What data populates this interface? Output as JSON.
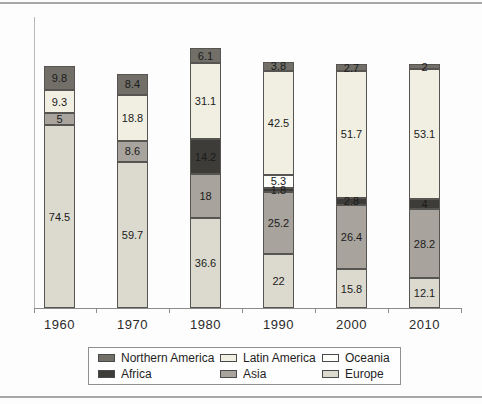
{
  "figure": {
    "background": "#fdfdfd",
    "frame_rule_color": "#a7a7a7"
  },
  "chart_data": {
    "type": "bar",
    "stacked": true,
    "title": "",
    "xlabel": "",
    "ylabel": "",
    "grid": false,
    "y_axis_labels_visible": false,
    "ylim": [
      0,
      110
    ],
    "legend_position": "bottom",
    "categories": [
      "1960",
      "1970",
      "1980",
      "1990",
      "2000",
      "2010"
    ],
    "series": [
      {
        "name": "Northern America",
        "color": "#716f68",
        "values": [
          9.8,
          8.4,
          6.1,
          3.8,
          2.7,
          2
        ],
        "labels": [
          "9.8",
          "8.4",
          "6.1",
          "3.8",
          "2.7",
          "2"
        ]
      },
      {
        "name": "Latin America",
        "color": "#f1efe2",
        "values": [
          9.3,
          18.8,
          31.1,
          42.5,
          51.7,
          53.1
        ],
        "labels": [
          "9.3",
          "18.8",
          "31.1",
          "42.5",
          "51.7",
          "53.1"
        ]
      },
      {
        "name": "Oceania",
        "color": "#fdfdfa",
        "values": [
          0,
          0,
          0,
          5.3,
          0,
          0
        ],
        "labels": [
          "",
          "",
          "",
          "5.3",
          "",
          ""
        ]
      },
      {
        "name": "Africa",
        "color": "#3e3c38",
        "values": [
          0,
          0,
          14.2,
          1.8,
          2.8,
          4
        ],
        "labels": [
          "",
          "",
          "14.2",
          "1.8",
          "2.8",
          "4"
        ]
      },
      {
        "name": "Asia",
        "color": "#a8a49d",
        "values": [
          5,
          8.6,
          18,
          25.2,
          26.4,
          28.2
        ],
        "labels": [
          "5",
          "8.6",
          "18",
          "25.2",
          "26.4",
          "28.2"
        ]
      },
      {
        "name": "Europe",
        "color": "#dcdacf",
        "values": [
          74.5,
          59.7,
          36.6,
          22,
          15.8,
          12.1
        ],
        "labels": [
          "74.5",
          "59.7",
          "36.6",
          "22",
          "15.8",
          "12.1"
        ]
      }
    ],
    "legend": [
      {
        "label": "Northern America",
        "color": "#716f68"
      },
      {
        "label": "Latin America",
        "color": "#f1efe2"
      },
      {
        "label": "Oceania",
        "color": "#fdfdfa"
      },
      {
        "label": "Africa",
        "color": "#3e3c38"
      },
      {
        "label": "Asia",
        "color": "#a8a49d"
      },
      {
        "label": "Europe",
        "color": "#dcdacf"
      }
    ]
  }
}
